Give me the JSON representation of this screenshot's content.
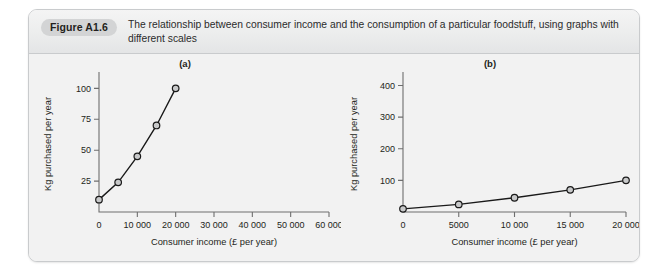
{
  "figure": {
    "badge_label": "Figure A1.6",
    "caption": "The relationship between consumer income and the consumption of a particular foodstuff, using graphs with different scales"
  },
  "chart_data": [
    {
      "type": "line",
      "panel_label": "(a)",
      "title": "(a)",
      "xlabel": "Consumer income (£ per year)",
      "ylabel": "Kg purchased per year",
      "x": [
        0,
        5000,
        10000,
        15000,
        20000
      ],
      "values": [
        10,
        24,
        45,
        70,
        100
      ],
      "xlim": [
        0,
        60000
      ],
      "ylim": [
        0,
        110
      ],
      "xticks": [
        0,
        10000,
        20000,
        30000,
        40000,
        50000,
        60000
      ],
      "xticklabels": [
        "0",
        "10 000",
        "20 000",
        "30 000",
        "40 000",
        "50 000",
        "60 000"
      ],
      "yticks": [
        25,
        50,
        75,
        100
      ],
      "yticklabels": [
        "25",
        "50",
        "75",
        "100"
      ],
      "grid": false,
      "legend": "none",
      "marker": "open-circle",
      "line_color": "#1a1a1a",
      "marker_fill": "#c8c9ca"
    },
    {
      "type": "line",
      "panel_label": "(b)",
      "title": "(b)",
      "xlabel": "Consumer income (£ per year)",
      "ylabel": "Kg purchased per year",
      "x": [
        0,
        5000,
        10000,
        15000,
        20000
      ],
      "values": [
        10,
        24,
        45,
        70,
        100
      ],
      "xlim": [
        0,
        20000
      ],
      "ylim": [
        0,
        430
      ],
      "xticks": [
        0,
        5000,
        10000,
        15000,
        20000
      ],
      "xticklabels": [
        "0",
        "5000",
        "10 000",
        "15 000",
        "20 000"
      ],
      "yticks": [
        100,
        200,
        300,
        400
      ],
      "yticklabels": [
        "100",
        "200",
        "300",
        "400"
      ],
      "grid": false,
      "legend": "none",
      "marker": "open-circle",
      "line_color": "#1a1a1a",
      "marker_fill": "#c8c9ca"
    }
  ]
}
